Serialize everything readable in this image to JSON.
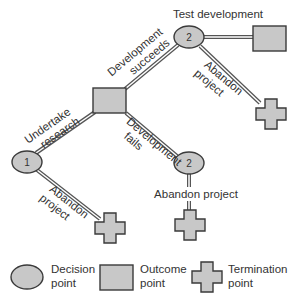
{
  "diagram": {
    "type": "decision-tree",
    "colors": {
      "shape_fill": "#c8c8c8",
      "shape_stroke": "#3a3a3a",
      "branch_fill": "#ffffff",
      "branch_stroke": "#555555",
      "text": "#333333"
    },
    "nodes": {
      "decision_1": {
        "label": "1"
      },
      "outcome_mid": {
        "label": ""
      },
      "decision_2_top": {
        "label": "2"
      },
      "decision_2_bottom": {
        "label": "2"
      },
      "outcome_top": {
        "label": ""
      },
      "termination_top": {
        "label": ""
      },
      "termination_bottom": {
        "label": ""
      },
      "termination_1": {
        "label": ""
      }
    },
    "branches": {
      "undertake_research": {
        "line1": "Undertake",
        "line2": "research"
      },
      "abandon_1": {
        "line1": "Abandon",
        "line2": "project"
      },
      "development_succeeds": {
        "line1": "Development",
        "line2": "succeeds"
      },
      "development_fails": {
        "line1": "Development",
        "line2": "fails"
      },
      "test_development": {
        "label": "Test development"
      },
      "abandon_top": {
        "line1": "Abandon",
        "line2": "project"
      },
      "abandon_bottom": {
        "label": "Abandon project"
      }
    }
  },
  "legend": {
    "items": [
      {
        "shape": "ellipse",
        "line1": "Decision",
        "line2": "point"
      },
      {
        "shape": "rectangle",
        "line1": "Outcome",
        "line2": "point"
      },
      {
        "shape": "cross",
        "line1": "Termination",
        "line2": "point"
      }
    ]
  }
}
